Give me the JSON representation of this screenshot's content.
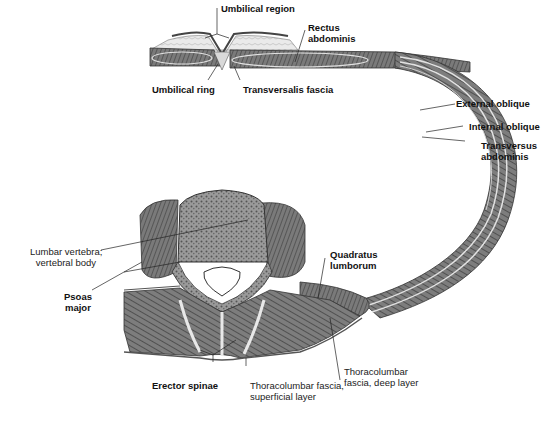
{
  "diagram": {
    "labels": {
      "umbilical_region": "Umbilical region",
      "rectus_abdominis_1": "Rectus",
      "rectus_abdominis_2": "abdominis",
      "umbilical_ring": "Umbilical ring",
      "transversalis_fascia": "Transversalis fascia",
      "external_oblique": "External oblique",
      "internal_oblique": "Internal oblique",
      "transversus_1": "Transversus",
      "transversus_2": "abdominis",
      "lumbar_vertebra_1": "Lumbar vertebra;",
      "lumbar_vertebra_2": "vertebral body",
      "psoas_1": "Psoas",
      "psoas_2": "major",
      "quadratus_1": "Quadratus",
      "quadratus_2": "lumborum",
      "erector_spinae": "Erector spinae",
      "tl_superficial_1": "Thoracolumbar fascia,",
      "tl_superficial_2": "superficial layer",
      "tl_deep_1": "Thoracolumbar",
      "tl_deep_2": "fascia, deep layer"
    },
    "colors": {
      "muscle": "#6e6e6e",
      "muscle_dark": "#4a4a4a",
      "fascia": "#d8d8d8",
      "bone": "#8a8a8a",
      "fat": "#e6e6e6",
      "line": "#222222"
    }
  }
}
